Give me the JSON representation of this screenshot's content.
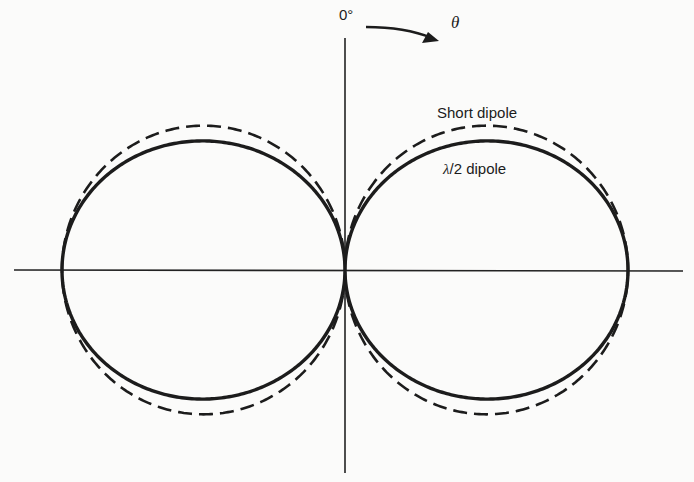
{
  "figure": {
    "title": "",
    "angle_origin_label": "0°",
    "angle_symbol": "θ",
    "legend": [
      {
        "label": "Short dipole",
        "style": "dashed"
      },
      {
        "label": "λ/2 dipole",
        "style": "solid"
      }
    ],
    "colors": {
      "line": "#1c1c1c",
      "background": "#fbfbfa"
    }
  },
  "labels": {
    "zero_deg": "0°",
    "theta": "θ",
    "short_dipole": "Short dipole",
    "half_wave_lambda": "λ",
    "half_wave_rest": "/2 dipole"
  },
  "geometry": {
    "center": [
      345,
      270
    ],
    "scale": 283,
    "h_axis": [
      14,
      683
    ],
    "v_axis": [
      38,
      473
    ]
  }
}
